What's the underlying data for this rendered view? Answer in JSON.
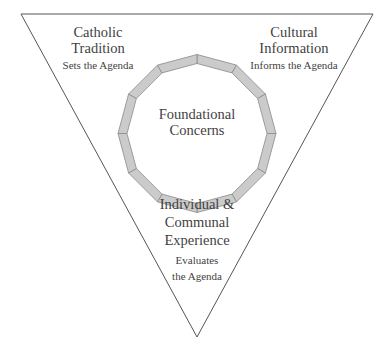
{
  "diagram": {
    "shape": "inverted-triangle",
    "colors": {
      "triangle_stroke": "#555555",
      "ring_fill": "#cbcbcb",
      "ring_stroke": "#8a8a8a",
      "text": "#3f3f3f",
      "background": "#ffffff"
    },
    "ring": {
      "segments": 12,
      "center_label": {
        "line1": "Foundational",
        "line2": "Concerns"
      }
    },
    "corners": {
      "top_left": {
        "title_line1": "Catholic",
        "title_line2": "Tradition",
        "role": "Sets the Agenda"
      },
      "top_right": {
        "title_line1": "Cultural",
        "title_line2": "Information",
        "role": "Informs the Agenda"
      },
      "bottom": {
        "title_line1": "Individual &",
        "title_line2": "Communal",
        "title_line3": "Experience",
        "role_line1": "Evaluates",
        "role_line2": "the Agenda"
      }
    }
  }
}
